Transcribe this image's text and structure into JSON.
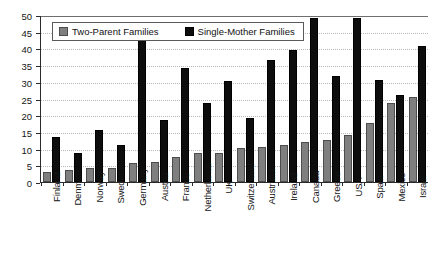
{
  "chart_data": {
    "type": "bar",
    "title": "",
    "xlabel": "",
    "ylabel": "",
    "ylim": [
      0,
      50
    ],
    "yticks": [
      0,
      5,
      10,
      15,
      20,
      25,
      30,
      35,
      40,
      45,
      50
    ],
    "grid": true,
    "legend_position": "top-left-inside",
    "categories": [
      "Finland",
      "Denmark",
      "Norway",
      "Sweden",
      "Germany",
      "Austria",
      "France",
      "Netherlands",
      "UK",
      "Switzerland",
      "Australia",
      "Ireland",
      "Canada",
      "Greece",
      "USA",
      "Spain",
      "Mexico",
      "Israel"
    ],
    "series": [
      {
        "name": "Two-Parent Families",
        "color": "#7f7f7f",
        "values": [
          2.5,
          3,
          3.5,
          3.5,
          5,
          5.5,
          7,
          8,
          8,
          9.5,
          10,
          10.5,
          11.5,
          12,
          13.5,
          17,
          23,
          25
        ]
      },
      {
        "name": "Single-Mother Families",
        "color": "#0d0d0d",
        "values": [
          13,
          8,
          15,
          10.5,
          42.5,
          18,
          33.5,
          23,
          29.5,
          18.5,
          36,
          39,
          48.5,
          31,
          48.5,
          30,
          25.5,
          40
        ]
      }
    ]
  },
  "legend": {
    "items": [
      {
        "label": "Two-Parent Families",
        "swatch": "two-parent"
      },
      {
        "label": "Single-Mother Families",
        "swatch": "single-mother"
      }
    ]
  }
}
